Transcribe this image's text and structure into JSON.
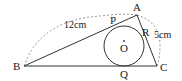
{
  "diagram": {
    "points": {
      "A": {
        "label": "A",
        "x": 137,
        "y": 15
      },
      "B": {
        "label": "B",
        "x": 24,
        "y": 66
      },
      "C": {
        "label": "C",
        "x": 157,
        "y": 66
      },
      "O": {
        "label": "O",
        "x": 124,
        "y": 46
      },
      "P": {
        "label": "P"
      },
      "Q": {
        "label": "Q"
      },
      "R": {
        "label": "R"
      }
    },
    "circle": {
      "center": "O",
      "radius": 20
    },
    "measurements": {
      "AB": "12cm",
      "AC": "5cm"
    },
    "colors": {
      "line": "#333333",
      "dashed": "#777777",
      "text": "#222222"
    }
  }
}
